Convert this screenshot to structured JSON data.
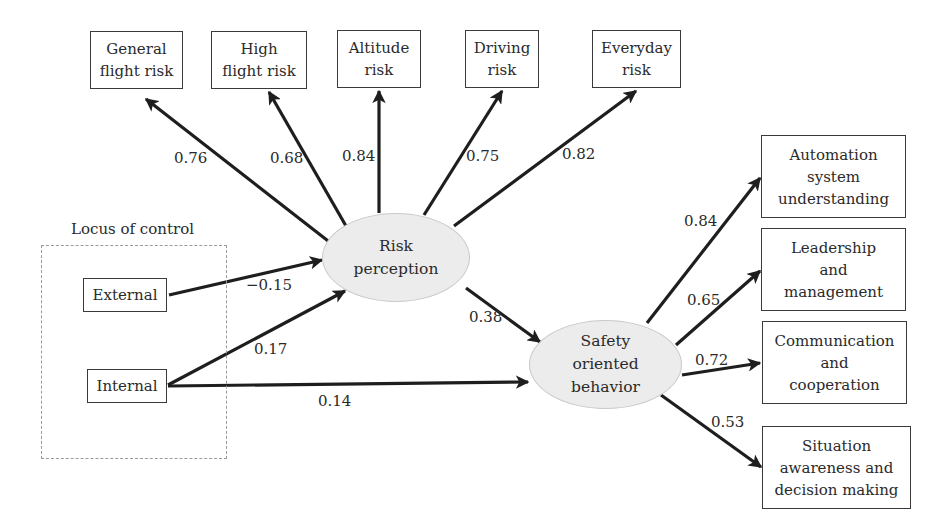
{
  "diagram": {
    "type": "structural-equation-model",
    "group": {
      "title": "Locus of control"
    },
    "observed_predictors": [
      {
        "id": "external",
        "label": "External"
      },
      {
        "id": "internal",
        "label": "Internal"
      }
    ],
    "latent_variables": [
      {
        "id": "risk",
        "lines": [
          "Risk",
          "perception"
        ]
      },
      {
        "id": "safety",
        "lines": [
          "Safety",
          "oriented",
          "behavior"
        ]
      }
    ],
    "risk_indicators": [
      {
        "id": "general",
        "lines": [
          "General",
          "flight risk"
        ],
        "loading": "0.76"
      },
      {
        "id": "high",
        "lines": [
          "High",
          "flight risk"
        ],
        "loading": "0.68"
      },
      {
        "id": "altitude",
        "lines": [
          "Altitude",
          "risk"
        ],
        "loading": "0.84"
      },
      {
        "id": "driving",
        "lines": [
          "Driving",
          "risk"
        ],
        "loading": "0.75"
      },
      {
        "id": "everyday",
        "lines": [
          "Everyday",
          "risk"
        ],
        "loading": "0.82"
      }
    ],
    "safety_indicators": [
      {
        "id": "automation",
        "lines": [
          "Automation",
          "system",
          "understanding"
        ],
        "loading": "0.84"
      },
      {
        "id": "leadership",
        "lines": [
          "Leadership",
          "and",
          "management"
        ],
        "loading": "0.65"
      },
      {
        "id": "communication",
        "lines": [
          "Communication",
          "and",
          "cooperation"
        ],
        "loading": "0.72"
      },
      {
        "id": "situation",
        "lines": [
          "Situation",
          "awareness and",
          "decision making"
        ],
        "loading": "0.53"
      }
    ],
    "paths": [
      {
        "from": "External",
        "to": "Risk perception",
        "coefficient": "−0.15"
      },
      {
        "from": "Internal",
        "to": "Risk perception",
        "coefficient": "0.17"
      },
      {
        "from": "Internal",
        "to": "Safety oriented behavior",
        "coefficient": "0.14"
      },
      {
        "from": "Risk perception",
        "to": "Safety oriented behavior",
        "coefficient": "0.38"
      }
    ]
  }
}
